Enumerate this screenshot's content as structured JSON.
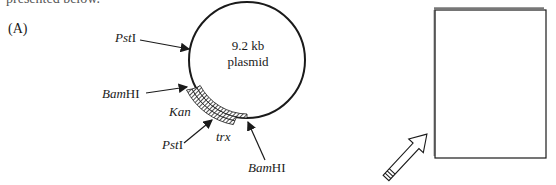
{
  "header": {
    "clipped_text": "presented below."
  },
  "panel": {
    "label": "(A)"
  },
  "plasmid": {
    "size_line1": "9.2 kb",
    "size_line2": "plasmid",
    "sites": [
      {
        "name": "PstI",
        "italic_part": "Pst",
        "roman_part": "I",
        "position": "upper-left"
      },
      {
        "name": "BamHI",
        "italic_part": "Bam",
        "roman_part": "HI",
        "position": "left"
      },
      {
        "name": "PstI",
        "italic_part": "Pst",
        "roman_part": "I",
        "position": "lower"
      },
      {
        "name": "BamHI",
        "italic_part": "Bam",
        "roman_part": "HI",
        "position": "bottom"
      }
    ],
    "genes": [
      {
        "name": "Kan",
        "italic": true
      },
      {
        "name": "trx",
        "italic": true
      }
    ]
  },
  "gel_box": {
    "label": ""
  },
  "colors": {
    "line": "#1a1a1a",
    "background": "#ffffff"
  }
}
